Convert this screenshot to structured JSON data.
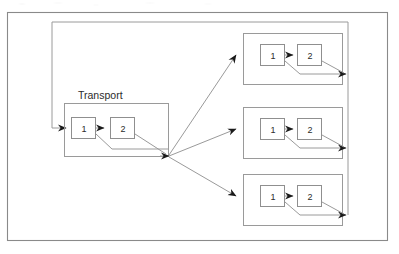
{
  "figure": {
    "kind": "block-diagram",
    "background_color": "#ffffff",
    "frame": {
      "stroke_color": "#8a8a8a",
      "x": 7,
      "y": 12,
      "width": 381,
      "height": 229
    },
    "line_color": "#9a9a9a",
    "box_stroke_color": "#8f8f8f",
    "arrow_color": "#1a1a1a",
    "text_color": "#2b2b2b"
  },
  "groups": [
    {
      "id": "transport",
      "title": "Transport",
      "title_x": 78,
      "title_y": 98,
      "has_title": true,
      "x": 64,
      "y": 103,
      "width": 105,
      "height": 54,
      "nodes": [
        {
          "label": "1",
          "x": 71,
          "y": 117,
          "width": 25,
          "height": 22
        },
        {
          "label": "2",
          "x": 110,
          "y": 117,
          "width": 25,
          "height": 22
        }
      ],
      "input_arrow_x": 53,
      "input_arrow_y": 128,
      "output_x": 168,
      "output_y": 156
    },
    {
      "id": "branch-top",
      "title": "",
      "has_title": false,
      "x": 243,
      "y": 33,
      "width": 100,
      "height": 52,
      "nodes": [
        {
          "label": "1",
          "x": 260,
          "y": 44,
          "width": 25,
          "height": 22
        },
        {
          "label": "2",
          "x": 297,
          "y": 44,
          "width": 25,
          "height": 22
        }
      ],
      "input_arrow_x": 243,
      "input_arrow_y": 55,
      "output_arrow_x": 348,
      "output_arrow_y": 74
    },
    {
      "id": "branch-middle",
      "title": "",
      "has_title": false,
      "x": 243,
      "y": 107,
      "width": 100,
      "height": 52,
      "nodes": [
        {
          "label": "1",
          "x": 260,
          "y": 118,
          "width": 25,
          "height": 22
        },
        {
          "label": "2",
          "x": 297,
          "y": 118,
          "width": 25,
          "height": 22
        }
      ],
      "input_arrow_x": 243,
      "input_arrow_y": 129,
      "output_arrow_x": 348,
      "output_arrow_y": 148
    },
    {
      "id": "branch-bottom",
      "title": "",
      "has_title": false,
      "x": 243,
      "y": 174,
      "width": 100,
      "height": 52,
      "nodes": [
        {
          "label": "1",
          "x": 260,
          "y": 185,
          "width": 25,
          "height": 22
        },
        {
          "label": "2",
          "x": 297,
          "y": 185,
          "width": 25,
          "height": 22
        }
      ],
      "input_arrow_x": 243,
      "input_arrow_y": 196,
      "output_arrow_x": 348,
      "output_arrow_y": 215
    }
  ],
  "feedback_loop": {
    "label": "",
    "top_y": 22,
    "left_x": 52,
    "right_x": 348,
    "entry_arrow_x": 69,
    "entry_arrow_y": 128
  },
  "fanout": {
    "junction_x": 168,
    "junction_y": 156,
    "branch_count": 3
  }
}
